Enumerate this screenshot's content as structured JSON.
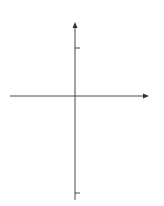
{
  "chart_data": {
    "type": "area",
    "title": "",
    "xlabel": "x",
    "ylabel": "y",
    "xlim": [
      -1.1,
      1.2
    ],
    "ylim": [
      -2.1,
      1.4
    ],
    "grid": false,
    "x_ticks": [
      {
        "value": -1,
        "label": "−1"
      },
      {
        "value": 0,
        "label": "0"
      },
      {
        "value": 1,
        "label": "1"
      }
    ],
    "y_ticks": [
      {
        "value": 1,
        "label": "1"
      },
      {
        "value": -2,
        "label": "−2"
      }
    ],
    "series": [
      {
        "name": "y = x^2",
        "label": "y = x",
        "label_exp": "2",
        "function": "x^2",
        "domain": [
          -1,
          1
        ],
        "x": [
          -1,
          -0.5,
          0,
          0.5,
          1
        ],
        "values": [
          1,
          0.25,
          0,
          0.25,
          1
        ]
      },
      {
        "name": "y = -2x^4",
        "label": "y = −2x",
        "label_exp": "4",
        "function": "-2*x^4",
        "domain": [
          -1,
          1
        ],
        "x": [
          -1,
          -0.5,
          0,
          0.5,
          1
        ],
        "values": [
          -2,
          -0.125,
          0,
          -0.125,
          -2
        ]
      }
    ],
    "shaded_region": {
      "between": [
        "x^2",
        "-2*x^4"
      ],
      "x_range": [
        -1,
        1
      ],
      "color": "#d9d9d9"
    },
    "colors": {
      "curve": "#555555",
      "axis": "#333333",
      "fill": "#d9d9d9"
    }
  }
}
